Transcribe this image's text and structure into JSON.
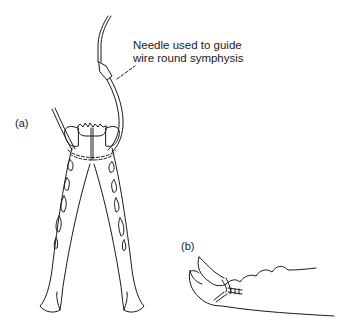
{
  "figure": {
    "annotation": {
      "line1": "Needle used to guide",
      "line2": "wire round symphysis"
    },
    "panel_a_label": "(a)",
    "panel_b_label": "(b)",
    "stroke_color": "#1a1a1a",
    "background": "#ffffff"
  }
}
